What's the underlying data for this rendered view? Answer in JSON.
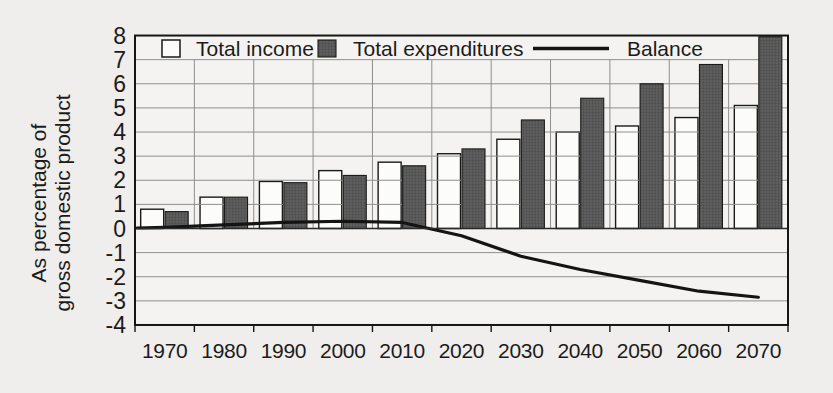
{
  "figure": {
    "y_axis_title_lines": [
      "As percentage of",
      "gross domestic product"
    ],
    "legend": [
      {
        "label": "Total income",
        "swatch": "open-bar"
      },
      {
        "label": "Total expenditures",
        "swatch": "filled-bar"
      },
      {
        "label": "Balance",
        "swatch": "line"
      }
    ],
    "colors": {
      "page_background": "#efeeec",
      "plot_background": "#f4f3f1",
      "open_bar_fill": "#fcfcfa",
      "filled_bar_fill": "#5e5e5e",
      "filled_bar_dot": "#4b4b4b",
      "bar_outline": "#1a1a1a",
      "balance_line": "#141414",
      "gridline": "#8f8f8f",
      "frame": "#151515",
      "text": "#1c1b1a"
    }
  },
  "chart_data": {
    "type": "bar",
    "title": "",
    "categories": [
      "1970",
      "1980",
      "1990",
      "2000",
      "2010",
      "2020",
      "2030",
      "2040",
      "2050",
      "2060",
      "2070"
    ],
    "series": [
      {
        "name": "Total income",
        "type": "bar",
        "style": "open",
        "values": [
          0.8,
          1.3,
          1.95,
          2.4,
          2.75,
          3.1,
          3.7,
          4.0,
          4.25,
          4.6,
          5.1
        ]
      },
      {
        "name": "Total expenditures",
        "type": "bar",
        "style": "filled",
        "values": [
          0.7,
          1.3,
          1.9,
          2.2,
          2.6,
          3.3,
          4.5,
          5.4,
          6.0,
          6.8,
          7.95
        ]
      },
      {
        "name": "Balance",
        "type": "line",
        "values": [
          0.05,
          0.15,
          0.25,
          0.3,
          0.25,
          -0.3,
          -1.15,
          -1.7,
          -2.15,
          -2.6,
          -2.85
        ]
      }
    ],
    "xlabel": "",
    "ylabel": "As percentage of gross domestic product",
    "ylim": [
      -4,
      8
    ],
    "yticks": [
      8,
      7,
      6,
      5,
      4,
      3,
      2,
      1,
      0,
      -1,
      -2,
      -3,
      -4
    ],
    "grid": true,
    "legend_position": "top-inside"
  }
}
